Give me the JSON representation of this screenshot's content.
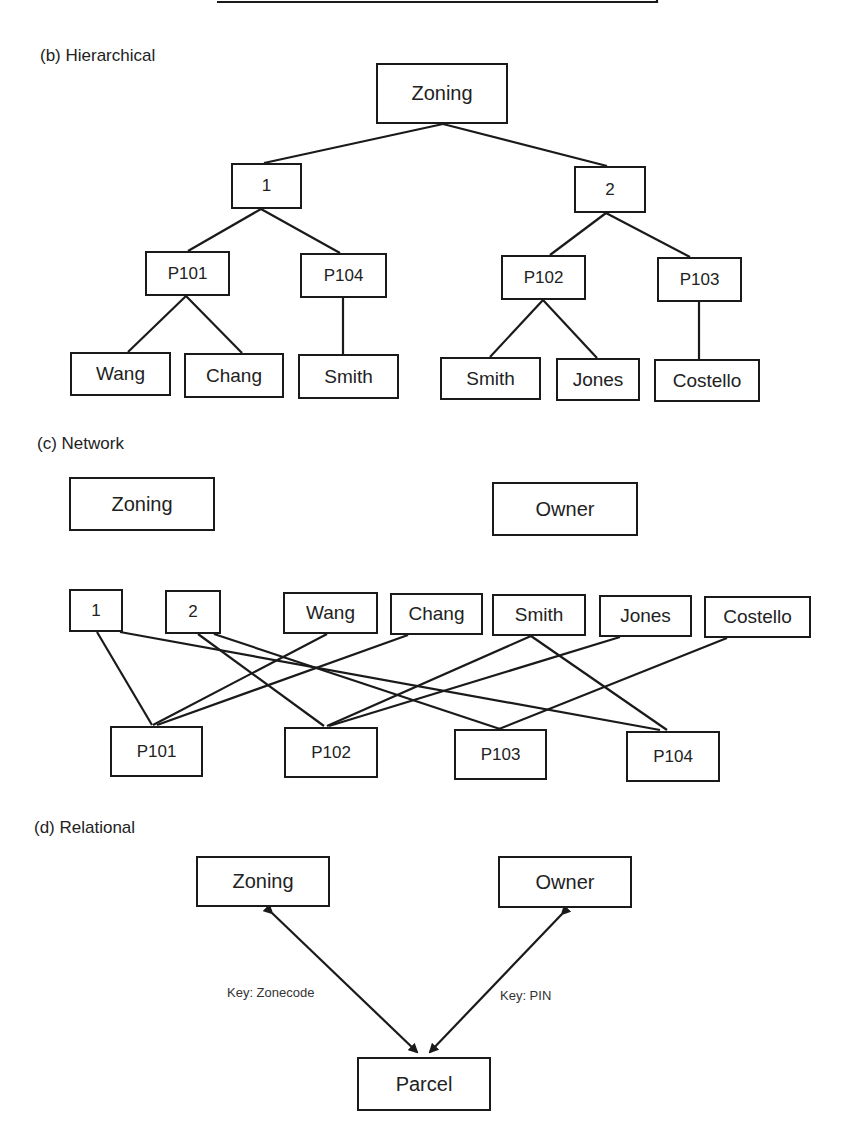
{
  "sections": {
    "hierarchical": {
      "label": "(b) Hierarchical",
      "root": "Zoning",
      "zones": [
        "1",
        "2"
      ],
      "parcels": [
        "P101",
        "P104",
        "P102",
        "P103"
      ],
      "owners": [
        "Wang",
        "Chang",
        "Smith",
        "Smith",
        "Jones",
        "Costello"
      ]
    },
    "network": {
      "label": "(c) Network",
      "zoning_title": "Zoning",
      "owner_title": "Owner",
      "zones": [
        "1",
        "2"
      ],
      "owners": [
        "Wang",
        "Chang",
        "Smith",
        "Jones",
        "Costello"
      ],
      "parcels": [
        "P101",
        "P102",
        "P103",
        "P104"
      ]
    },
    "relational": {
      "label": "(d) Relational",
      "zoning": "Zoning",
      "owner": "Owner",
      "parcel": "Parcel",
      "key_zonecode": "Key: Zonecode",
      "key_pin": "Key: PIN"
    }
  },
  "colors": {
    "line": "#1a1a1a",
    "background": "#ffffff"
  }
}
